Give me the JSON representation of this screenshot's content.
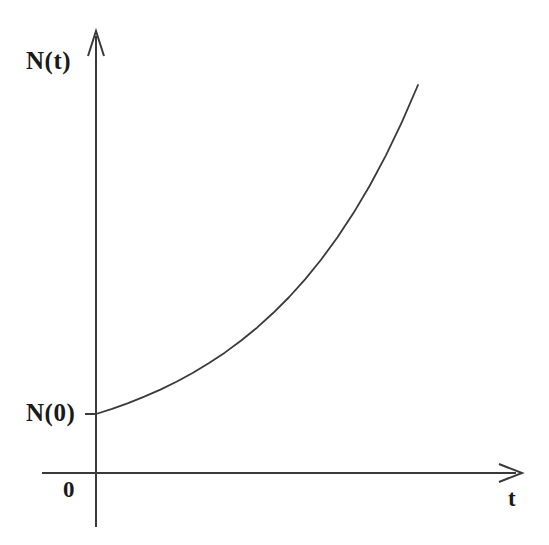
{
  "figure": {
    "title": "",
    "background_color": "#ffffff",
    "line_color": "#3a3a3a",
    "text_color": "#1a1a1a",
    "width": 549,
    "height": 545
  },
  "labels": {
    "y_axis": "N(t)",
    "initial_value": "N(0)",
    "origin": "0",
    "x_axis": "t"
  },
  "chart_data": {
    "type": "line",
    "title": "",
    "xlabel": "t",
    "ylabel": "N(t)",
    "grid": false,
    "legend": null,
    "annotations": [
      {
        "text": "N(t)",
        "role": "y-axis-label",
        "x": 0,
        "y": 1.0
      },
      {
        "text": "N(0)",
        "role": "y-intercept-label",
        "x": 0,
        "y": 0.0
      },
      {
        "text": "0",
        "role": "origin-label",
        "x": 0,
        "y": 0
      },
      {
        "text": "t",
        "role": "x-axis-label",
        "x": 1.0,
        "y": 0
      }
    ],
    "xlim": [
      0,
      1
    ],
    "ylim": [
      0,
      1
    ],
    "series": [
      {
        "name": "N(t) = N(0)e^(kt)",
        "x": [
          0.0,
          0.05,
          0.1,
          0.15,
          0.2,
          0.25,
          0.3,
          0.35,
          0.4,
          0.45,
          0.5,
          0.55,
          0.6,
          0.65,
          0.7,
          0.75,
          0.8,
          0.85,
          0.9,
          0.95,
          1.0
        ],
        "y": [
          0.0,
          0.019,
          0.04,
          0.064,
          0.09,
          0.119,
          0.151,
          0.187,
          0.226,
          0.27,
          0.318,
          0.372,
          0.431,
          0.497,
          0.57,
          0.651,
          0.741,
          0.841,
          0.952,
          1.075,
          1.212
        ]
      }
    ],
    "curve_pixels": {
      "start": [
        96,
        414
      ],
      "end": [
        418,
        85
      ],
      "origin": [
        96,
        473
      ]
    }
  },
  "axes": {
    "y_axis": {
      "x": 96,
      "top": 32,
      "bottom": 527,
      "arrow": "up"
    },
    "x_axis": {
      "y": 473,
      "left": 42,
      "right": 520,
      "arrow": "right"
    }
  }
}
